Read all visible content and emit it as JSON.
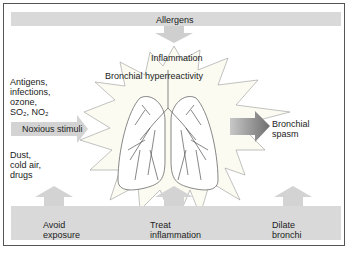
{
  "top_bar": {
    "label": "Allergens"
  },
  "center": {
    "inflammation": "Inflammation",
    "hyperreactivity": "Bronchial hyperreactivity"
  },
  "left": {
    "top_text": "Antigens,\ninfections,\nozone,",
    "so2_line": "SO₂, NO₂",
    "arrow_label": "Noxious stimuli",
    "bottom_text": "Dust,\ncold air,\ndrugs"
  },
  "right": {
    "arrow_label": "Bronchial\nspasm"
  },
  "bottom_bar": {
    "items": [
      {
        "label": "Avoid\nexposure"
      },
      {
        "label": "Treat\ninflammation"
      },
      {
        "label": "Dilate\nbronchi"
      }
    ]
  },
  "colors": {
    "bar": "#d9d9d9",
    "arrow_dark": "#7a7a7a",
    "burst": "#fbfbf2",
    "line": "#444444"
  }
}
